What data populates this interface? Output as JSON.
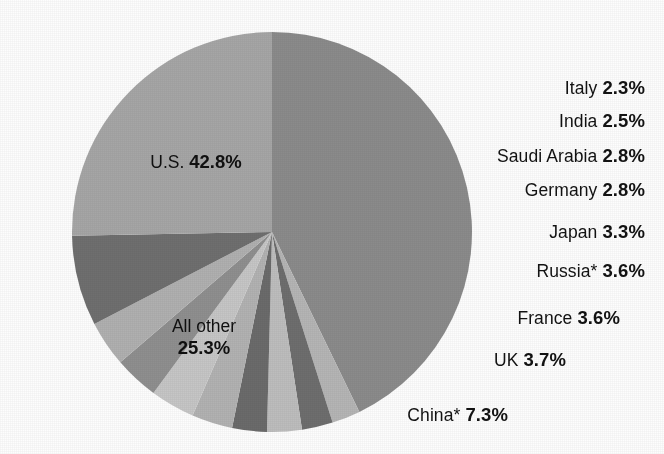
{
  "chart_data": {
    "type": "pie",
    "title": "",
    "subtitle": "",
    "xlabel": "",
    "ylabel": "",
    "legend_position": "none",
    "grid": false,
    "units": "percent",
    "start_angle_deg": 0,
    "direction": "clockwise",
    "categories": [
      "U.S.",
      "Italy",
      "India",
      "Saudi Arabia",
      "Germany",
      "Japan",
      "Russia*",
      "France",
      "UK",
      "China*",
      "All other"
    ],
    "values": [
      42.8,
      2.3,
      2.5,
      2.8,
      2.8,
      3.3,
      3.6,
      3.6,
      3.7,
      7.3,
      25.3
    ],
    "slices": [
      {
        "label": "U.S.",
        "value": 42.8,
        "value_text": "42.8%",
        "color": "#8b8b8b",
        "label_placement": "inside"
      },
      {
        "label": "Italy",
        "value": 2.3,
        "value_text": "2.3%",
        "color": "#b5b5b5",
        "label_placement": "outside"
      },
      {
        "label": "India",
        "value": 2.5,
        "value_text": "2.5%",
        "color": "#6e6e6e",
        "label_placement": "outside"
      },
      {
        "label": "Saudi Arabia",
        "value": 2.8,
        "value_text": "2.8%",
        "color": "#bdbdbd",
        "label_placement": "outside"
      },
      {
        "label": "Germany",
        "value": 2.8,
        "value_text": "2.8%",
        "color": "#6b6b6b",
        "label_placement": "outside"
      },
      {
        "label": "Japan",
        "value": 3.3,
        "value_text": "3.3%",
        "color": "#b2b2b2",
        "label_placement": "outside"
      },
      {
        "label": "Russia*",
        "value": 3.6,
        "value_text": "3.6%",
        "color": "#c6c6c6",
        "label_placement": "outside"
      },
      {
        "label": "France",
        "value": 3.6,
        "value_text": "3.6%",
        "color": "#8f8f8f",
        "label_placement": "outside"
      },
      {
        "label": "UK",
        "value": 3.7,
        "value_text": "3.7%",
        "color": "#b0b0b0",
        "label_placement": "outside"
      },
      {
        "label": "China*",
        "value": 7.3,
        "value_text": "7.3%",
        "color": "#6f6f6f",
        "label_placement": "outside"
      },
      {
        "label": "All other",
        "value": 25.3,
        "value_text": "25.3%",
        "color": "#a6a6a6",
        "label_placement": "inside"
      }
    ]
  },
  "geometry": {
    "center_x": 272,
    "center_y": 232,
    "radius": 200
  },
  "labels": {
    "inside": [
      {
        "name": "us",
        "name_text": "U.S.",
        "pct_text": "42.8%",
        "x": 196,
        "y": 162,
        "stacked": false
      },
      {
        "name": "allother",
        "name_text": "All other",
        "pct_text": "25.3%",
        "x": 204,
        "y": 338,
        "stacked": true
      }
    ],
    "outside": [
      {
        "name": "italy",
        "name_text": "Italy",
        "pct_text": "2.3%",
        "x": 645,
        "y": 88
      },
      {
        "name": "india",
        "name_text": "India",
        "pct_text": "2.5%",
        "x": 645,
        "y": 121
      },
      {
        "name": "saudi",
        "name_text": "Saudi Arabia",
        "pct_text": "2.8%",
        "x": 645,
        "y": 156
      },
      {
        "name": "germany",
        "name_text": "Germany",
        "pct_text": "2.8%",
        "x": 645,
        "y": 190
      },
      {
        "name": "japan",
        "name_text": "Japan",
        "pct_text": "3.3%",
        "x": 645,
        "y": 232
      },
      {
        "name": "russia",
        "name_text": "Russia*",
        "pct_text": "3.6%",
        "x": 645,
        "y": 271
      },
      {
        "name": "france",
        "name_text": "France",
        "pct_text": "3.6%",
        "x": 620,
        "y": 318
      },
      {
        "name": "uk",
        "name_text": "UK",
        "pct_text": "3.7%",
        "x": 566,
        "y": 360
      },
      {
        "name": "china",
        "name_text": "China*",
        "pct_text": "7.3%",
        "x": 508,
        "y": 415
      }
    ]
  },
  "colors": {
    "background": "#fdfdfd",
    "text": "#121212",
    "light_gray": "#b5b5b5",
    "dark_gray": "#6e6e6e",
    "mid_gray": "#8b8b8b"
  }
}
